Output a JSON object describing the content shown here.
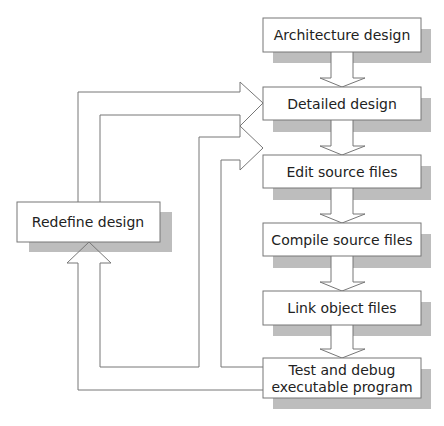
{
  "diagram": {
    "nodes": [
      {
        "id": "architecture",
        "label": "Architecture design"
      },
      {
        "id": "detailed",
        "label": "Detailed design"
      },
      {
        "id": "edit",
        "label": "Edit source files"
      },
      {
        "id": "compile",
        "label": "Compile source files"
      },
      {
        "id": "link",
        "label": "Link object files"
      },
      {
        "id": "test",
        "label_line1": "Test and debug",
        "label_line2": "executable program"
      },
      {
        "id": "redefine",
        "label": "Redefine design"
      }
    ],
    "edges": [
      {
        "from": "architecture",
        "to": "detailed"
      },
      {
        "from": "detailed",
        "to": "edit"
      },
      {
        "from": "edit",
        "to": "compile"
      },
      {
        "from": "compile",
        "to": "link"
      },
      {
        "from": "link",
        "to": "test"
      },
      {
        "from": "test",
        "to": "redefine"
      },
      {
        "from": "test",
        "to": "edit"
      },
      {
        "from": "redefine",
        "to": "detailed"
      }
    ],
    "colors": {
      "shadow": "#b8b8b8",
      "line": "#777777",
      "box_fill": "#ffffff"
    }
  }
}
